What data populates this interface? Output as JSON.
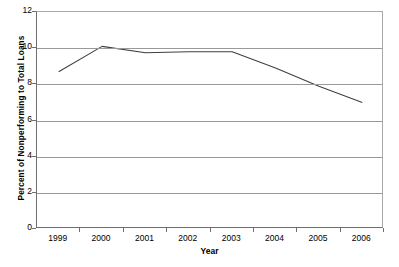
{
  "chart_data": {
    "type": "line",
    "title": "",
    "xlabel": "Year",
    "ylabel": "Percent of Nonperforming to Total Loans",
    "categories": [
      "1999",
      "2000",
      "2001",
      "2002",
      "2003",
      "2004",
      "2005",
      "2006"
    ],
    "series": [
      {
        "name": "Percent of Nonperforming to Total Loans",
        "values": [
          8.7,
          10.1,
          9.75,
          9.8,
          9.8,
          8.9,
          7.9,
          7.0
        ],
        "color": "#404040"
      }
    ],
    "ylim": [
      0,
      12
    ],
    "y_ticks": [
      "0",
      "2",
      "4",
      "6",
      "8",
      "10",
      "12"
    ],
    "y_tick_values": [
      0,
      2,
      4,
      6,
      8,
      10,
      12
    ],
    "grid": true,
    "grid_axis": "y",
    "legend": false,
    "legend_position": "none",
    "gridline_color": "#999999",
    "frame_color": "#a9a9a9",
    "axis_color": "#6e6e6e",
    "plot_background": "#ffffff"
  },
  "axis_titles": {
    "x": "Year",
    "y": "Percent of Nonperforming to Total Loans"
  }
}
